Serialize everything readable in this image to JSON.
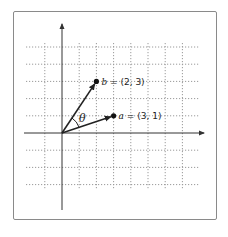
{
  "diagram": {
    "type": "vector-angle-on-grid",
    "origin_px": [
      62,
      133
    ],
    "unit_px": 17.2,
    "grid": {
      "x_range": [
        -1,
        7
      ],
      "y_range": [
        -3,
        5
      ],
      "style": "dotted",
      "color": "#9a9a9a"
    },
    "axes": {
      "color": "#333333"
    },
    "vectors": [
      {
        "name": "b",
        "coords": [
          2,
          3
        ],
        "label_var": "b",
        "label_rest": " = (2, 3)"
      },
      {
        "name": "a",
        "coords": [
          3,
          1
        ],
        "label_var": "a",
        "label_rest": " = (3, 1)"
      }
    ],
    "angle_label": "θ"
  }
}
